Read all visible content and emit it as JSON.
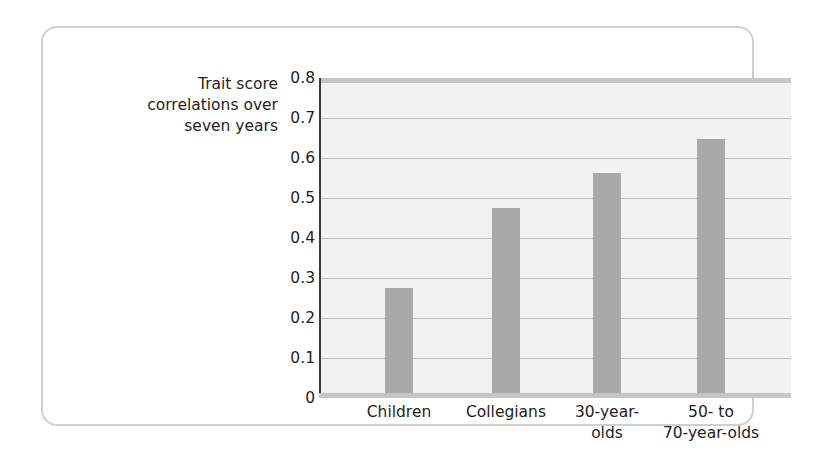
{
  "figure": {
    "y_axis_caption": "Trait score\ncorrelations over\nseven years"
  },
  "chart_data": {
    "type": "bar",
    "title": "",
    "xlabel": "",
    "ylabel": "Trait score correlations over seven years",
    "categories": [
      "Children",
      "Collegians",
      "30-year-\nolds",
      "50- to\n70-year-olds"
    ],
    "values": [
      0.31,
      0.54,
      0.64,
      0.74
    ],
    "ylim": [
      0,
      0.85
    ],
    "yticks": [
      0,
      0.1,
      0.2,
      0.3,
      0.4,
      0.5,
      0.6,
      0.7,
      0.8
    ],
    "ytick_labels": [
      "0",
      "0.1",
      "0.2",
      "0.3",
      "0.4",
      "0.5",
      "0.6",
      "0.7",
      "0.8"
    ],
    "grid": true,
    "legend": false,
    "legend_position": "none",
    "series": [
      {
        "name": "Trait score correlations over seven years",
        "values": [
          0.31,
          0.54,
          0.64,
          0.74
        ],
        "color": "#a9a9a9"
      }
    ],
    "colors": {
      "bar": "#a9a9a9",
      "plot_background": "#f2f2f2",
      "gridline": "#bdbdbd",
      "axis": "#3b3b3b",
      "card_border": "#cfcfcf",
      "text": "#231f20"
    }
  }
}
